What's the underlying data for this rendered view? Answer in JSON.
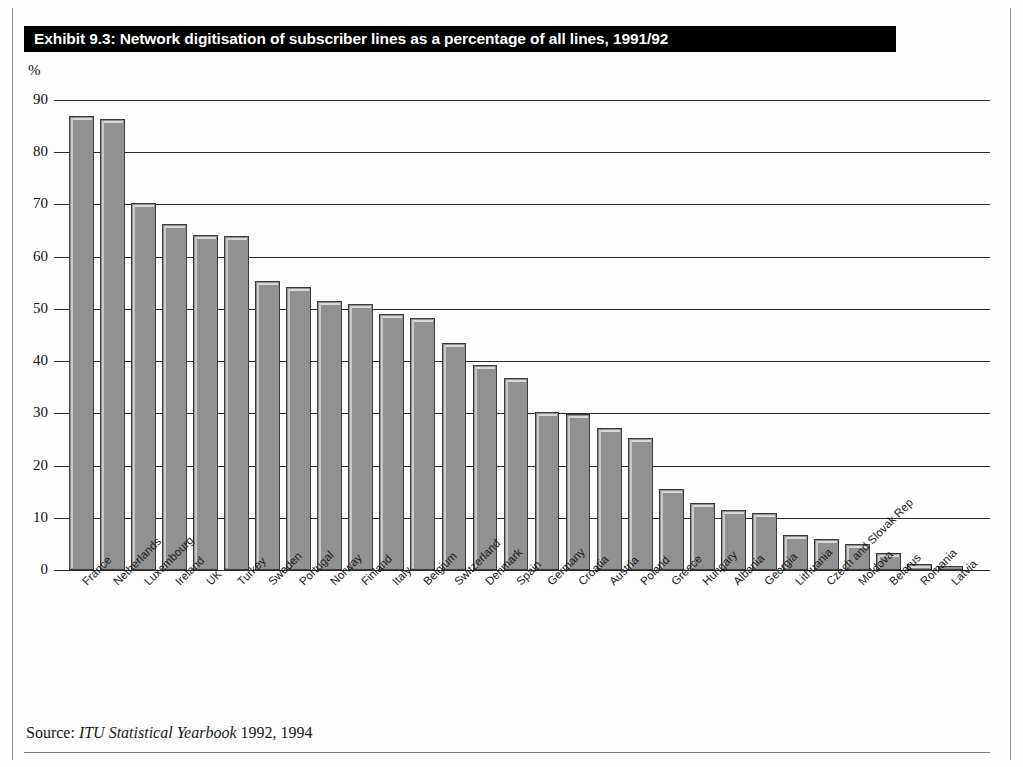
{
  "title": "Exhibit 9.3: Network digitisation of subscriber lines as a percentage of all lines, 1991/92",
  "source": {
    "prefix": "Source:",
    "publication": "ITU Statistical Yearbook",
    "years": "1992, 1994"
  },
  "colors": {
    "bar_fill": "#919191",
    "bar_outline": "#3a3a3a",
    "bar_highlight": "#d8d8d8",
    "title_bar_background": "#000000",
    "title_text": "#ffffff",
    "gridline": "#2a2a2a"
  },
  "chart_data": {
    "type": "bar",
    "title": "Exhibit 9.3: Network digitisation of subscriber lines as a percentage of all lines, 1991/92",
    "subtitle": "",
    "xlabel": "",
    "ylabel": "%",
    "ylim": [
      0,
      90
    ],
    "ytick_labels": [
      "90",
      "80",
      "70",
      "60",
      "50",
      "40",
      "30",
      "20",
      "10",
      "0"
    ],
    "yticks": [
      90,
      80,
      70,
      60,
      50,
      40,
      30,
      20,
      10,
      0
    ],
    "grid": true,
    "legend": "none",
    "categories": [
      "France",
      "Netherlands",
      "Luxembourg",
      "Ireland",
      "UK",
      "Turkey",
      "Sweden",
      "Portugal",
      "Norway",
      "Finland",
      "Italy",
      "Belgium",
      "Switzerland",
      "Denmark",
      "Spain",
      "Germany",
      "Croatia",
      "Austria",
      "Poland",
      "Greece",
      "Hungary",
      "Albania",
      "Georgia",
      "Lithuania",
      "Czech and Slovak Rep",
      "Moldova",
      "Belarus",
      "Romania",
      "Latvia"
    ],
    "values": [
      87.0,
      86.3,
      70.3,
      66.3,
      64.2,
      63.9,
      55.3,
      54.2,
      51.6,
      51.0,
      49.0,
      48.3,
      43.5,
      39.3,
      36.8,
      30.2,
      29.8,
      27.2,
      25.3,
      15.5,
      12.8,
      11.4,
      11.0,
      6.7,
      6.0,
      5.0,
      3.2,
      1.2,
      0.8
    ]
  }
}
